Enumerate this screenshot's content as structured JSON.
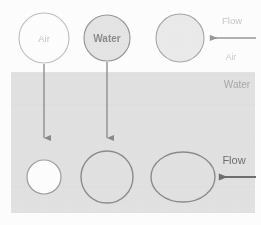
{
  "figure": {
    "canvas": {
      "width": 261,
      "height": 225,
      "background": "#ffffff"
    },
    "media_band": {
      "label": "Water",
      "fill": "#e3e3e3",
      "x": 11,
      "y": 72,
      "width": 244,
      "height": 141
    },
    "upper_medium_label": "Air",
    "labels": {
      "air_bubble": "Air",
      "water_drop": "Water",
      "top_flow": "Flow",
      "bottom_flow": "Flow",
      "right_air": "Air",
      "right_water": "Water"
    },
    "colors": {
      "outline_light": "#b9b9b9",
      "outline_dark": "#8d8d8d",
      "band_fill": "#e3e3e3",
      "white_fill": "#ffffff",
      "text_light": "#c2c2c2",
      "text_mid": "#b0b0b0",
      "text_dark": "#7d7d7d",
      "arrow": "#8a8a8a",
      "arrow_dark": "#6f6f6f"
    },
    "shapes": {
      "top_air_circle": {
        "cx": 44,
        "cy": 38,
        "r": 25,
        "fill": "#ffffff",
        "stroke": "#c0c0c0"
      },
      "top_water_circle": {
        "cx": 107,
        "cy": 38,
        "r": 23,
        "fill": "#e6e6e6",
        "stroke": "#9a9a9a"
      },
      "top_right_circle": {
        "cx": 180,
        "cy": 38,
        "r": 24,
        "fill": "#ececec",
        "stroke": "#a8a8a8"
      },
      "bottom_air_circle": {
        "cx": 44,
        "cy": 177,
        "r": 17,
        "fill": "#ffffff",
        "stroke": "#9e9e9e"
      },
      "bottom_water_circle": {
        "cx": 107,
        "cy": 177,
        "r": 26,
        "fill": "none",
        "stroke": "#8d8d8d"
      },
      "bottom_right_ellipse": {
        "cx": 183,
        "cy": 177,
        "rx": 32,
        "ry": 25,
        "fill": "none",
        "stroke": "#8d8d8d"
      }
    },
    "arrows": {
      "air_down": {
        "x": 44,
        "y_start": 64,
        "y_end": 140
      },
      "water_down": {
        "x": 107,
        "y_start": 62,
        "y_end": 140
      },
      "top_flow": {
        "y": 38,
        "x_start": 256,
        "x_end": 208
      },
      "bottom_flow": {
        "y": 177,
        "x_start": 256,
        "x_end": 216
      }
    },
    "label_positions": {
      "air_bubble": {
        "x": 44,
        "y": 42
      },
      "water_drop": {
        "x": 107,
        "y": 42
      },
      "top_flow": {
        "x": 232,
        "y": 24
      },
      "right_air": {
        "x": 231,
        "y": 59
      },
      "right_water": {
        "x": 237,
        "y": 87
      },
      "bottom_flow": {
        "x": 234,
        "y": 164
      }
    }
  }
}
